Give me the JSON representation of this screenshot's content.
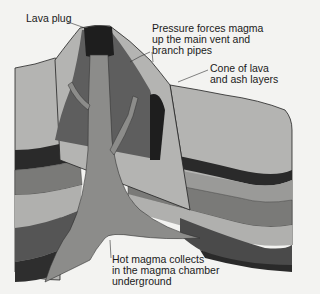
{
  "diagram": {
    "labels": {
      "lava_plug": "Lava plug",
      "pressure": "Pressure forces magma\nup the main vent and\nbranch pipes",
      "cone": "Cone of lava\nand ash layers",
      "chamber": "Hot magma collects\nin the magma chamber\nunderground"
    },
    "colors": {
      "background": "#f3f3f1",
      "cone_light": "#b4b4b2",
      "cone_dark": "#5e5e5e",
      "magma": "#8c8c8a",
      "lava_plug": "#1e1e1e",
      "dark_band": "#2e2e2e",
      "brick": "#7a7a78",
      "striped": "#a6a6a4",
      "deep": "#555555"
    }
  }
}
